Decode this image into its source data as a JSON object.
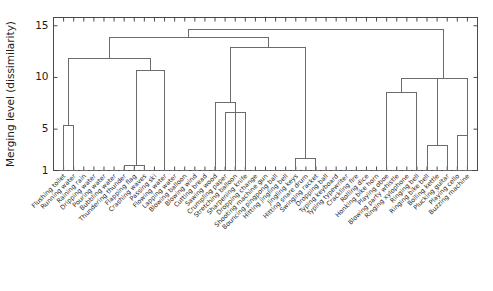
{
  "figure": {
    "background": "#ffffff",
    "line_color": "#6b6b6b",
    "axis_color": "#4a4a4a",
    "text_color": "#1d1d1d"
  },
  "chart_data": {
    "type": "dendrogram",
    "title": "",
    "xlabel": "",
    "ylabel": "Merging level (dissimilarity)",
    "ylim": [
      1,
      15.8
    ],
    "yticks": [
      1,
      5,
      10,
      15
    ],
    "ytick_labels": [
      "1",
      "5",
      "10",
      "15"
    ],
    "grid": false,
    "legend": null,
    "leaf_baseline": 1,
    "leaves": [
      "Flushing toilet",
      "Running water",
      "Raining rain",
      "Dripping water",
      "Pouring water",
      "Bubbling water",
      "Thundering thunder",
      "Flapping flag",
      "Crashing waves",
      "Passing ski",
      "Flowing water",
      "Lapping water",
      "Blowing balloon",
      "Blowing wind",
      "Cutting bread",
      "Sawing wood",
      "Crumpling paper",
      "Stretching balloon",
      "Sharpening knife",
      "Dropping change",
      "Shooting machine gun",
      "Bouncing pingpong ball",
      "Hitting jingling bell",
      "Jingling keys",
      "Hitting snare drum",
      "Swinging racket",
      "Dropping ball",
      "Typing keyboard",
      "Typing typewriter",
      "Crackling fire",
      "Rolling dice",
      "Honking bike horn",
      "Playing oboe",
      "Blowing party whistle",
      "Ringing xylophone",
      "Ringing bell",
      "Ringing bike bell",
      "Boiling kettle",
      "Plucking guitar",
      "Playing cello",
      "Buzzing machine"
    ],
    "merges": [
      {
        "id": "m1",
        "left": "leaf:1",
        "right": "leaf:2",
        "height": 5.4
      },
      {
        "id": "m2",
        "left": "leaf:7",
        "right": "leaf:8",
        "height": 1.45
      },
      {
        "id": "m3",
        "left": "m2",
        "right": "leaf:9",
        "height": 1.45
      },
      {
        "id": "m4",
        "left": "m3",
        "right": "leaf:11",
        "height": 10.7
      },
      {
        "id": "m5",
        "left": "m1",
        "right": "m4",
        "height": 11.85
      },
      {
        "id": "m6",
        "left": "leaf:16",
        "right": "leaf:18",
        "height": 7.6
      },
      {
        "id": "m7",
        "left": "leaf:17",
        "right": "leaf:19",
        "height": 6.6
      },
      {
        "id": "m8",
        "left": "m6",
        "right": "m7",
        "height": 7.6
      },
      {
        "id": "m9",
        "left": "leaf:24",
        "right": "leaf:26",
        "height": 2.2
      },
      {
        "id": "m10",
        "left": "m8",
        "right": "m9",
        "height": 12.9
      },
      {
        "id": "m11",
        "left": "m5",
        "right": "m10",
        "height": 13.85
      },
      {
        "id": "m12",
        "left": "leaf:33",
        "right": "leaf:36",
        "height": 8.5
      },
      {
        "id": "m13",
        "left": "leaf:37",
        "right": "leaf:39",
        "height": 3.4
      },
      {
        "id": "m14",
        "left": "m12",
        "right": "m13",
        "height": 9.9
      },
      {
        "id": "m15",
        "left": "m14",
        "right": "leaf:41",
        "height": 9.9
      },
      {
        "id": "m16",
        "left": "leaf:40",
        "right": "leaf:41",
        "height": 4.4
      },
      {
        "id": "m17",
        "left": "m11",
        "right": "m15",
        "height": 14.65
      }
    ]
  }
}
